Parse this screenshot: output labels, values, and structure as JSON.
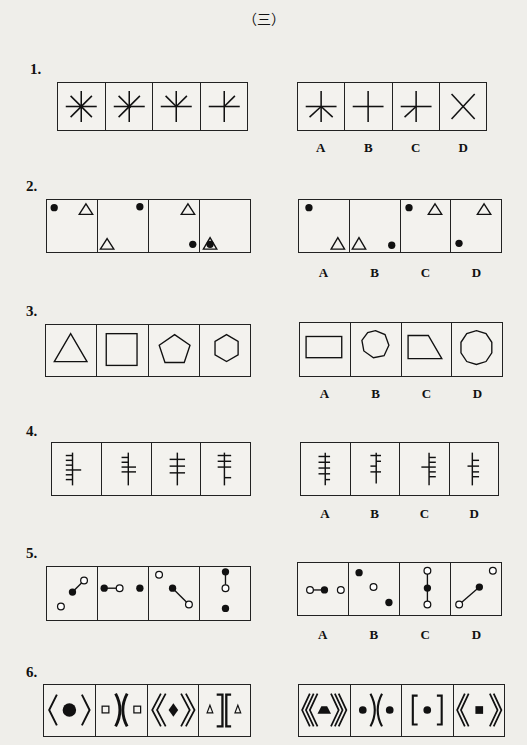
{
  "page_title": "（三）",
  "questions": [
    {
      "number": "1.",
      "options": [
        "A",
        "B",
        "C",
        "D"
      ]
    },
    {
      "number": "2.",
      "options": [
        "A",
        "B",
        "C",
        "D"
      ]
    },
    {
      "number": "3.",
      "options": [
        "A",
        "B",
        "C",
        "D"
      ]
    },
    {
      "number": "4.",
      "options": [
        "A",
        "B",
        "C",
        "D"
      ]
    },
    {
      "number": "5.",
      "options": [
        "A",
        "B",
        "C",
        "D"
      ]
    },
    {
      "number": "6.",
      "options": [
        "A",
        "B",
        "C",
        "D"
      ]
    }
  ]
}
